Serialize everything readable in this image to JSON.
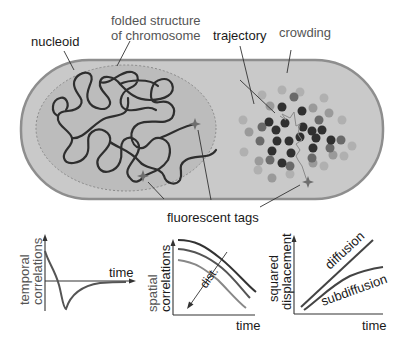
{
  "diagram": {
    "colors": {
      "cell_fill": "#c9c9c9",
      "cell_border": "#8e8e8e",
      "nucleoid_fill": "#b8b8b8",
      "nucleoid_border": "#8a8a8a",
      "chromosome": "#2e2e2e",
      "tag": "#6e6e6e",
      "dot_dark": "#303030",
      "dot_mid": "#6a6a6a",
      "dot_light": "#9e9e9e",
      "dot_pale": "#b0b0b0"
    },
    "labels": {
      "nucleoid": "nucleoid",
      "folded_line1": "folded structure",
      "folded_line2": "of chromosome",
      "trajectory": "trajectory",
      "crowding": "crowding",
      "fluorescent_tags": "fluorescent tags"
    },
    "panels": {
      "temporal": {
        "ylabel_line1": "temporal",
        "ylabel_line2": "correlations",
        "xlabel": "time"
      },
      "spatial": {
        "ylabel_line1": "spatial",
        "ylabel_line2": "correlations",
        "xlabel": "time",
        "arrow_label": "dist."
      },
      "displacement": {
        "ylabel_line1": "squared",
        "ylabel_line2": "displacement",
        "xlabel": "time",
        "curve1": "diffusion",
        "curve2": "subdiffusion"
      }
    }
  }
}
